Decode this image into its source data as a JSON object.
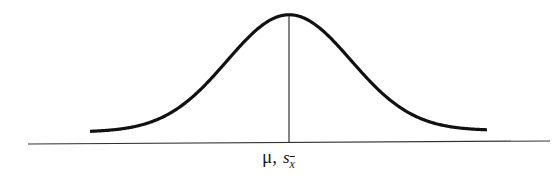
{
  "figure": {
    "type": "normal-distribution-curve",
    "colors": {
      "curve": "#111111",
      "axis": "#333333",
      "background": "#ffffff"
    },
    "label": {
      "mu": "μ",
      "separator": ",",
      "s": "s",
      "subscript": "x"
    }
  },
  "chart_data": {
    "type": "line",
    "title": "",
    "xlabel": "μ, s_x̄",
    "ylabel": "",
    "grid": false,
    "legend": null,
    "annotations": [
      "μ, s_x̄"
    ]
  }
}
